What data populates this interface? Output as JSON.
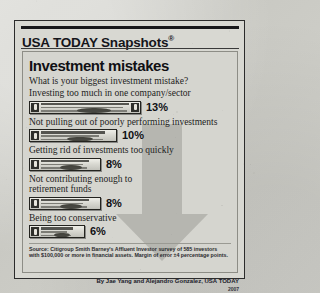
{
  "brand": {
    "name": "USA TODAY Snapshots",
    "registered_mark": "®"
  },
  "headline": "Investment mistakes",
  "question": "What is your biggest investment mistake?",
  "source": "Source: Citigroup Smith Barney's Affluent Investor survey of 585 investors with $100,000 or more in financial assets. Margin of error ±4 percentage points.",
  "byline": "By Jae Yang and Alejandro Gonzalez, USA TODAY",
  "year": "2007",
  "colors": {
    "paper": "#d2d2cc",
    "panel": "#d5d5cf",
    "ink": "#101014",
    "arrow_gray": "#b6b6b0",
    "rule": "#17171a"
  },
  "chart_data": {
    "type": "bar",
    "title": "Investment mistakes",
    "subtitle": "What is your biggest investment mistake?",
    "xlabel": "",
    "ylabel": "",
    "xlim": [
      0,
      13
    ],
    "grid": false,
    "legend": "none",
    "orientation": "horizontal",
    "value_suffix": "%",
    "categories": [
      "Investing too much in one company/sector",
      "Not pulling out of poorly performing investments",
      "Getting rid of investments too quickly",
      "Not contributing enough to retirement funds",
      "Being too conservative"
    ],
    "values": [
      13,
      10,
      8,
      8,
      6
    ],
    "labels": [
      "13%",
      "10%",
      "8%",
      "8%",
      "6%"
    ],
    "bar_style": "dollar-bill-graphic"
  },
  "rows": [
    {
      "label": "Investing too much in one company/sector",
      "value": 13,
      "label_pct": "13%",
      "bar_px": 112
    },
    {
      "label": "Not pulling out of poorly performing investments",
      "value": 10,
      "label_pct": "10%",
      "bar_px": 88
    },
    {
      "label": "Getting rid of investments too quickly",
      "value": 8,
      "label_pct": "8%",
      "bar_px": 72
    },
    {
      "label": "Not contributing enough to\nretirement funds",
      "value": 8,
      "label_pct": "8%",
      "bar_px": 72
    },
    {
      "label": "Being too conservative",
      "value": 6,
      "label_pct": "6%",
      "bar_px": 56
    }
  ]
}
